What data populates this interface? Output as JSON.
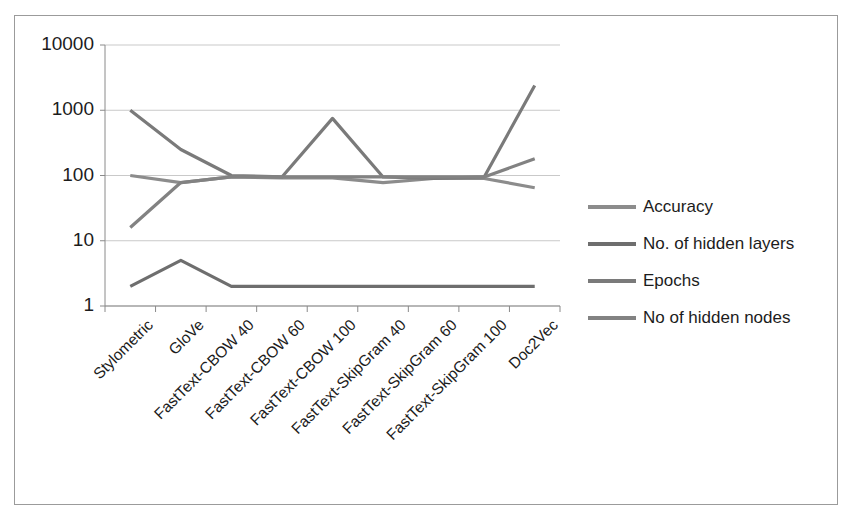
{
  "chart_data": {
    "type": "line",
    "title": "",
    "xlabel": "",
    "ylabel": "",
    "yscale": "log",
    "ylim": [
      1,
      10000
    ],
    "yticks": [
      "1",
      "10",
      "100",
      "1000",
      "10000"
    ],
    "grid": true,
    "legend_position": "right",
    "categories": [
      "Stylometric",
      "GloVe",
      "FastText-CBOW 40",
      "FastText-CBOW 60",
      "FastText-CBOW 100",
      "FastText-SkipGram 40",
      "FastText-SkipGram 60",
      "FastText-SkipGram 100",
      "Doc2Vec"
    ],
    "series": [
      {
        "name": "Accuracy",
        "color": "#8c8c8c",
        "values": [
          100,
          78,
          95,
          92,
          92,
          78,
          90,
          90,
          65
        ]
      },
      {
        "name": "No. of hidden layers",
        "color": "#6e6e6e",
        "values": [
          2,
          5,
          2,
          2,
          2,
          2,
          2,
          2,
          2
        ]
      },
      {
        "name": "Epochs",
        "color": "#7a7a7a",
        "values": [
          1000,
          250,
          100,
          95,
          750,
          95,
          90,
          95,
          2400
        ]
      },
      {
        "name": "No of hidden nodes",
        "color": "#828282",
        "values": [
          16,
          78,
          95,
          95,
          95,
          95,
          95,
          95,
          180
        ]
      }
    ]
  },
  "legend": {
    "items": [
      {
        "label": "Accuracy"
      },
      {
        "label": "No. of hidden layers"
      },
      {
        "label": "Epochs"
      },
      {
        "label": "No of hidden nodes"
      }
    ]
  },
  "axes": {
    "y_tick_labels": [
      "10000",
      "1000",
      "100",
      "10",
      "1"
    ],
    "x_tick_labels": [
      "Stylometric",
      "GloVe",
      "FastText-CBOW 40",
      "FastText-CBOW 60",
      "FastText-CBOW 100",
      "FastText-SkipGram 40",
      "FastText-SkipGram 60",
      "FastText-SkipGram 100",
      "Doc2Vec"
    ]
  },
  "colors": {
    "frame": "#9b9b9b",
    "axis": "#8a8a8a",
    "gridline": "#c9c9c9",
    "text": "#1c1c1c",
    "background": "#ffffff"
  }
}
